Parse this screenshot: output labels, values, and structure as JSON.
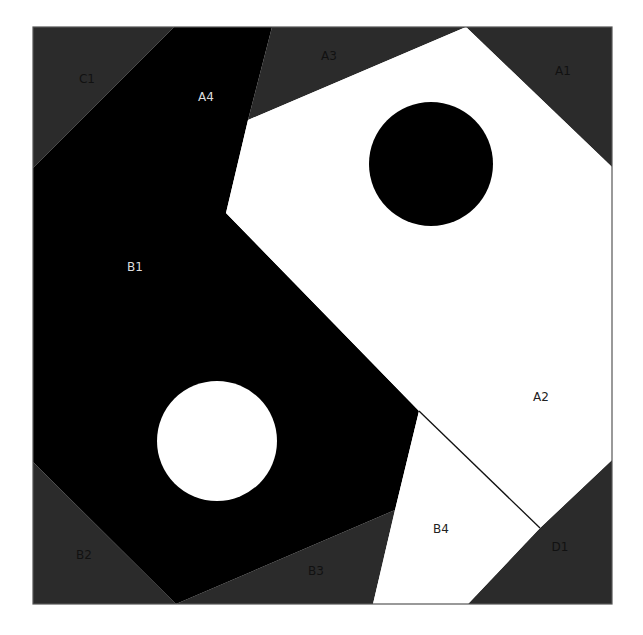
{
  "colors": {
    "background": "#ffffff",
    "dark_gray": "#2b2b2b",
    "black": "#000000",
    "white": "#ffffff",
    "border": "#555555",
    "label_on_dark": "#111111",
    "label_on_black": "#dddddd",
    "label_on_white": "#222222"
  },
  "frame": {
    "x": 33,
    "y": 27,
    "width": 579,
    "height": 577
  },
  "regions": [
    {
      "id": "C1",
      "fill": "dark_gray",
      "points": "33,27 174,27 33,168"
    },
    {
      "id": "A3",
      "fill": "dark_gray",
      "points": "272,27 466,27 248,120"
    },
    {
      "id": "A1",
      "fill": "dark_gray",
      "points": "466,27 612,27 612,167"
    },
    {
      "id": "D1",
      "fill": "dark_gray",
      "points": "612,460 612,604 468,604 540,528"
    },
    {
      "id": "B3",
      "fill": "dark_gray",
      "points": "395,510 373,604 176,604"
    },
    {
      "id": "B2",
      "fill": "dark_gray",
      "points": "33,462 33,604 176,604"
    },
    {
      "id": "B1-A4",
      "fill": "black",
      "points": "174,27 272,27 248,120 226,213 419,411 395,510 176,604 33,462 33,168"
    },
    {
      "id": "A2",
      "fill": "white",
      "points": "466,27 612,167 612,460 540,528 419,411 226,213 248,120"
    },
    {
      "id": "B4",
      "fill": "white",
      "points": "419,411 540,528 468,604 373,604 395,510"
    }
  ],
  "divider_line": {
    "x1": 419,
    "y1": 411,
    "x2": 540,
    "y2": 528
  },
  "circles": [
    {
      "id": "black-dot",
      "cx": 431,
      "cy": 164,
      "r": 62,
      "fill": "black"
    },
    {
      "id": "white-dot",
      "cx": 217,
      "cy": 441,
      "r": 60,
      "fill": "white"
    }
  ],
  "labels": [
    {
      "text": "C1",
      "x": 87,
      "y": 83,
      "color": "label_on_dark"
    },
    {
      "text": "A4",
      "x": 206,
      "y": 101,
      "color": "label_on_black"
    },
    {
      "text": "A3",
      "x": 329,
      "y": 60,
      "color": "label_on_dark"
    },
    {
      "text": "A1",
      "x": 563,
      "y": 75,
      "color": "label_on_dark"
    },
    {
      "text": "B1",
      "x": 135,
      "y": 271,
      "color": "label_on_black"
    },
    {
      "text": "A2",
      "x": 541,
      "y": 401,
      "color": "label_on_white"
    },
    {
      "text": "B4",
      "x": 441,
      "y": 533,
      "color": "label_on_white"
    },
    {
      "text": "D1",
      "x": 560,
      "y": 551,
      "color": "label_on_dark"
    },
    {
      "text": "B2",
      "x": 84,
      "y": 559,
      "color": "label_on_dark"
    },
    {
      "text": "B3",
      "x": 316,
      "y": 575,
      "color": "label_on_dark"
    }
  ]
}
